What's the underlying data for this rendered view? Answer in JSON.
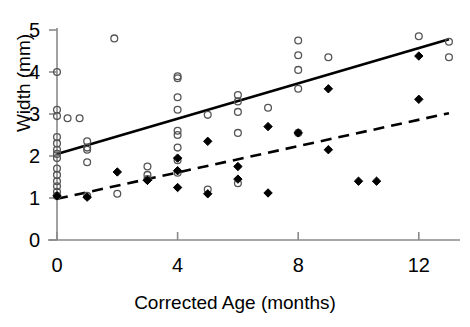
{
  "chart_data": {
    "type": "scatter",
    "title": "",
    "xlabel": "Corrected Age (months)",
    "ylabel": "Width (mm)",
    "xlim": [
      -0.4,
      13.4
    ],
    "ylim": [
      0,
      5.4
    ],
    "xticks": [
      0,
      4,
      8,
      12
    ],
    "xtick_labels": [
      "0",
      "4",
      "8",
      "12"
    ],
    "yticks": [
      0,
      1,
      2,
      3,
      4,
      5
    ],
    "ytick_labels": [
      "0",
      "1",
      "2",
      "3",
      "4",
      "5"
    ],
    "grid": false,
    "legend": "none",
    "series": [
      {
        "name": "open-circles",
        "marker": "open-circle",
        "color": "#555555",
        "points": [
          [
            0,
            3.1
          ],
          [
            0,
            2.95
          ],
          [
            0,
            2.45
          ],
          [
            0,
            2.3
          ],
          [
            0,
            2.15
          ],
          [
            0,
            2.05
          ],
          [
            0,
            1.95
          ],
          [
            0,
            1.7
          ],
          [
            0,
            1.55
          ],
          [
            0,
            1.4
          ],
          [
            0,
            1.28
          ],
          [
            0,
            1.15
          ],
          [
            0,
            1.05
          ],
          [
            0,
            4.0
          ],
          [
            0.35,
            2.9
          ],
          [
            0.75,
            2.9
          ],
          [
            1.0,
            2.35
          ],
          [
            1.0,
            2.2
          ],
          [
            1.0,
            2.15
          ],
          [
            1.0,
            1.85
          ],
          [
            1.0,
            1.05
          ],
          [
            1.9,
            4.8
          ],
          [
            2.0,
            1.1
          ],
          [
            3.0,
            1.75
          ],
          [
            3.0,
            1.55
          ],
          [
            3.0,
            1.45
          ],
          [
            4.0,
            3.9
          ],
          [
            4.0,
            3.85
          ],
          [
            4.0,
            3.4
          ],
          [
            4.0,
            3.1
          ],
          [
            4.0,
            2.6
          ],
          [
            4.0,
            2.5
          ],
          [
            4.0,
            2.2
          ],
          [
            4.0,
            1.9
          ],
          [
            4.0,
            1.6
          ],
          [
            5.0,
            2.98
          ],
          [
            5.0,
            1.2
          ],
          [
            6.0,
            3.45
          ],
          [
            6.0,
            3.3
          ],
          [
            6.0,
            3.05
          ],
          [
            6.0,
            2.55
          ],
          [
            6.0,
            1.35
          ],
          [
            7.0,
            3.15
          ],
          [
            8.0,
            4.75
          ],
          [
            8.0,
            4.4
          ],
          [
            8.0,
            4.05
          ],
          [
            8.0,
            3.6
          ],
          [
            8.0,
            2.55
          ],
          [
            9.0,
            4.35
          ],
          [
            12.0,
            4.85
          ],
          [
            13.0,
            4.72
          ],
          [
            13.0,
            4.35
          ]
        ]
      },
      {
        "name": "filled-diamonds",
        "marker": "filled-diamond",
        "color": "#000000",
        "points": [
          [
            0,
            1.05
          ],
          [
            1.0,
            1.02
          ],
          [
            2.0,
            1.62
          ],
          [
            3.0,
            1.42
          ],
          [
            3.0,
            1.42
          ],
          [
            4.0,
            1.95
          ],
          [
            4.0,
            1.65
          ],
          [
            4.0,
            1.25
          ],
          [
            5.0,
            2.35
          ],
          [
            5.0,
            1.1
          ],
          [
            6.0,
            1.75
          ],
          [
            6.0,
            1.45
          ],
          [
            7.0,
            2.7
          ],
          [
            7.0,
            1.12
          ],
          [
            8.0,
            2.55
          ],
          [
            9.0,
            3.6
          ],
          [
            9.0,
            2.15
          ],
          [
            10.0,
            1.4
          ],
          [
            10.6,
            1.4
          ],
          [
            12.0,
            4.38
          ],
          [
            12.0,
            3.35
          ]
        ]
      }
    ],
    "trend_lines": [
      {
        "name": "solid-regression-line",
        "style": "solid",
        "color": "#000000",
        "x_start": 0,
        "y_start": 2.05,
        "x_end": 13.0,
        "y_end": 4.78
      },
      {
        "name": "dashed-regression-line",
        "style": "dashed",
        "color": "#000000",
        "x_start": 0,
        "y_start": 0.98,
        "x_end": 13.0,
        "y_end": 3.02
      }
    ]
  },
  "axis": {
    "x_title": "Corrected Age (months)",
    "y_title": "Width (mm)"
  }
}
